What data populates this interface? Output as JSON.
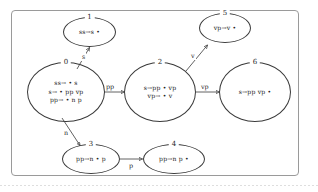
{
  "diagram": {
    "type": "state-machine",
    "frame": {
      "border_color": "#9a9a9a",
      "background": "#ffffff"
    },
    "ink_color": "#3a3a3a",
    "states": [
      {
        "id": "0",
        "label": "0",
        "items": [
          "ss→ • s",
          "s→ • pp vp",
          "pp→ • n p"
        ]
      },
      {
        "id": "1",
        "label": "1",
        "items": [
          "ss→s •"
        ]
      },
      {
        "id": "2",
        "label": "2",
        "items": [
          "s→pp • vp",
          "vp→ • v"
        ]
      },
      {
        "id": "3",
        "label": "3",
        "items": [
          "pp→n • p"
        ]
      },
      {
        "id": "4",
        "label": "4",
        "items": [
          "pp→n p •"
        ]
      },
      {
        "id": "5",
        "label": "5",
        "items": [
          "vp→v •"
        ]
      },
      {
        "id": "6",
        "label": "6",
        "items": [
          "s→pp vp •"
        ]
      }
    ],
    "transitions": [
      {
        "id": "t0-1",
        "from": "0",
        "to": "1",
        "label": "s"
      },
      {
        "id": "t0-2",
        "from": "0",
        "to": "2",
        "label": "pp"
      },
      {
        "id": "t0-3",
        "from": "0",
        "to": "3",
        "label": "n"
      },
      {
        "id": "t2-5",
        "from": "2",
        "to": "5",
        "label": "v"
      },
      {
        "id": "t2-6",
        "from": "2",
        "to": "6",
        "label": "vp"
      },
      {
        "id": "t3-4",
        "from": "3",
        "to": "4",
        "label": "p"
      }
    ]
  }
}
